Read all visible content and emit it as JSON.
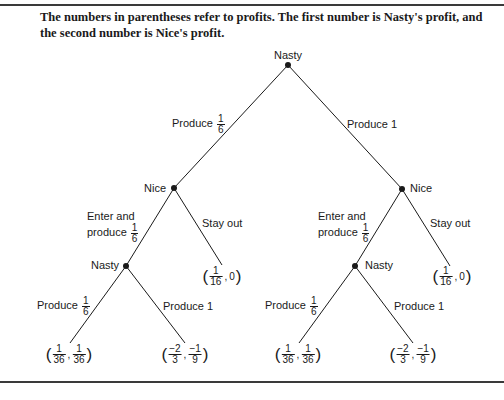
{
  "caption": "The numbers in parentheses refer to profits. The first number is Nasty's profit, and the second number is Nice's profit.",
  "nodes": {
    "root": "Nasty",
    "nice_left": "Nice",
    "nice_right": "Nice",
    "nasty_left": "Nasty",
    "nasty_right": "Nasty"
  },
  "branches": {
    "root_left": {
      "text": "Produce",
      "num": "1",
      "den": "6"
    },
    "root_right": {
      "text": "Produce 1"
    },
    "nice_left_enter": {
      "line1": "Enter and",
      "line2": "produce",
      "num": "1",
      "den": "6"
    },
    "nice_left_stay": {
      "text": "Stay out"
    },
    "nice_right_enter": {
      "line1": "Enter and",
      "line2": "produce",
      "num": "1",
      "den": "6"
    },
    "nice_right_stay": {
      "text": "Stay out"
    },
    "nasty_left_small": {
      "text": "Produce",
      "num": "1",
      "den": "6"
    },
    "nasty_left_big": {
      "text": "Produce 1"
    },
    "nasty_right_small": {
      "text": "Produce",
      "num": "1",
      "den": "6"
    },
    "nasty_right_big": {
      "text": "Produce 1"
    }
  },
  "payoffs": {
    "left_stay": {
      "a_num": "1",
      "a_den": "16",
      "b": "0"
    },
    "right_stay": {
      "a_num": "1",
      "a_den": "16",
      "b": "0"
    },
    "ll": {
      "a_num": "1",
      "a_den": "36",
      "b_num": "1",
      "b_den": "36"
    },
    "lr": {
      "a_num": "−2",
      "a_den": "3",
      "b_num": "−1",
      "b_den": "9"
    },
    "rl": {
      "a_num": "1",
      "a_den": "36",
      "b_num": "1",
      "b_den": "36"
    },
    "rr": {
      "a_num": "−2",
      "a_den": "3",
      "b_num": "−1",
      "b_den": "9"
    }
  },
  "colors": {
    "ink": "#1a1a1a",
    "rule": "#3a3a3a"
  }
}
